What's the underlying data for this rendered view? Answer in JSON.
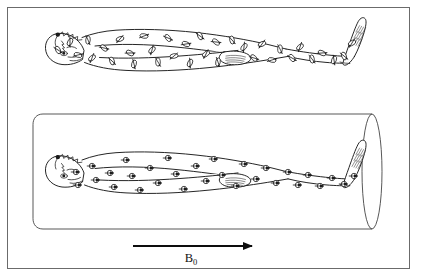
{
  "figure": {
    "domain": "diagram",
    "background_color": "#ffffff",
    "frame": {
      "visible": true,
      "color": "#6b6b6b",
      "line_width_px": 1.6,
      "inset_px": 7
    },
    "ink_color": "#1a1a1a",
    "panels": [
      {
        "id": "panel-top",
        "name": "random-spin-orientation-panel",
        "caption_text": "",
        "description": "Supine human body with randomly oriented nuclear spins, no external magnetic field present",
        "has_bore": false,
        "spin_state": "random",
        "spin_count": 34
      },
      {
        "id": "panel-bottom",
        "name": "aligned-spin-in-bore-panel",
        "caption_text": "",
        "description": "Same supine human body inside a cylindrical magnet bore; all nuclear spins aligned parallel to the static field",
        "has_bore": true,
        "spin_state": "aligned",
        "spin_alignment_direction": "right",
        "spin_count": 30
      }
    ],
    "field_arrow": {
      "name": "b0-field-arrow",
      "label_main": "B",
      "label_subscript": "0",
      "label_full": "B₀",
      "direction": "right",
      "color": "#0d0d0d",
      "x_start": 133,
      "x_end": 259,
      "y": 246
    },
    "bore": {
      "name": "magnet-bore-cylinder",
      "stroke_color": "#3a3a3a",
      "left_x": 33,
      "right_x": 380,
      "top_y": 114,
      "bottom_y": 229,
      "end_ellipse_rx": 10,
      "end_ellipse_ry": 57
    },
    "spins": {
      "random_symbol": "ellipse-with-diagonal-arrow",
      "aligned_symbol": "circle-with-horizontal-arrow",
      "stroke_color": "#1a1a1a"
    }
  },
  "chart_data": {
    "type": "diagram",
    "annotations": [
      "B₀"
    ],
    "series": [
      {
        "name": "random spins (no field)",
        "panel": "top",
        "orientation_degrees": [
          62,
          118,
          15,
          95,
          140,
          40,
          72,
          160,
          28,
          105,
          8,
          133,
          88,
          52,
          170,
          20,
          115,
          65,
          145,
          35,
          100,
          78,
          125,
          45,
          155,
          12,
          92,
          58,
          138,
          82,
          25,
          110,
          68,
          150
        ]
      },
      {
        "name": "aligned spins (B₀ applied)",
        "panel": "bottom",
        "orientation_degrees": [
          0,
          0,
          0,
          0,
          0,
          0,
          0,
          0,
          0,
          0,
          0,
          0,
          0,
          0,
          0,
          0,
          0,
          0,
          0,
          0,
          0,
          0,
          0,
          0,
          0,
          0,
          0,
          0,
          0,
          0
        ]
      }
    ],
    "xlabel": "",
    "ylabel": "",
    "grid": false,
    "legend": "none"
  }
}
